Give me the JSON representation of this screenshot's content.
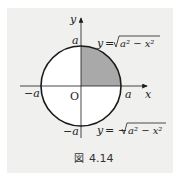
{
  "figure": {
    "caption_symbol": "図",
    "caption_number": "4.14",
    "labels": {
      "y_axis": "y",
      "x_axis": "x",
      "origin": "O",
      "top_a": "a",
      "right_a": "a",
      "left_neg_a": "−a",
      "bottom_neg_a": "−a",
      "upper_eq_lhs": "y",
      "upper_eq_eq": "=",
      "upper_eq_sqrt_body": "a² − x²",
      "lower_eq_lhs": "y",
      "lower_eq_eq": "= −",
      "lower_eq_sqrt_body": "a² − x²"
    },
    "colors": {
      "shade": "#a9a9a9",
      "circle_fill": "#ffffff",
      "stroke": "#1a1a1a",
      "panel_bg": "#f0f0ee"
    },
    "geometry": {
      "center": [
        81,
        86
      ],
      "radius": 40,
      "shaded_quadrant": "first"
    }
  }
}
